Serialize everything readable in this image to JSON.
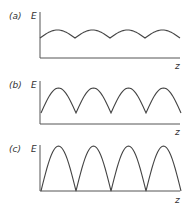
{
  "panels": [
    {
      "id": "a",
      "label": "(a)",
      "y_label": "E",
      "x_label": "z",
      "description": "Weak periodic modulation: shallow arches with cusps, curve well above axis",
      "origin": [
        40,
        58
      ],
      "y_top": 12,
      "x_end": 180,
      "valley_y": 38,
      "peak_y": 30,
      "valleys_x": [
        40,
        75,
        110,
        145,
        180
      ]
    },
    {
      "id": "b",
      "label": "(b)",
      "y_label": "E",
      "x_label": "z",
      "description": "Stronger modulation: taller arches, cusps closer to axis",
      "origin": [
        40,
        124
      ],
      "y_top": 81,
      "x_end": 180,
      "valley_y": 113,
      "peak_y": 88,
      "valleys_x": [
        41,
        76,
        111,
        146,
        181
      ]
    },
    {
      "id": "c",
      "label": "(c)",
      "y_label": "E",
      "x_label": "z",
      "description": "Full modulation: arches reach down to the axis (rectified sine shape)",
      "origin": [
        40,
        191
      ],
      "y_top": 145,
      "x_end": 180,
      "valley_y": 191,
      "peak_y": 146,
      "valleys_x": [
        41,
        76,
        111,
        146,
        181
      ]
    }
  ]
}
